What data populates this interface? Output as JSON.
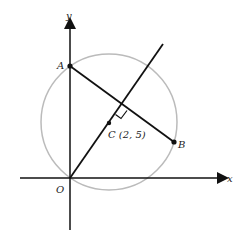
{
  "diagram": {
    "axes": {
      "x_label": "x",
      "y_label": "y",
      "origin_label": "O"
    },
    "points": {
      "A": {
        "label": "A"
      },
      "B": {
        "label": "B"
      },
      "C": {
        "label": "C (2, 5)",
        "coords": [
          2,
          5
        ]
      }
    },
    "circle": {
      "center": "C",
      "stroke": "#bbbbbb"
    },
    "lines": [
      {
        "name": "chord-AB",
        "from": "A",
        "to": "B"
      },
      {
        "name": "line-OC",
        "from": "O",
        "through": "C",
        "perpendicular_to": "AB"
      }
    ],
    "colors": {
      "ink": "#111111",
      "circle": "#bbbbbb"
    }
  }
}
